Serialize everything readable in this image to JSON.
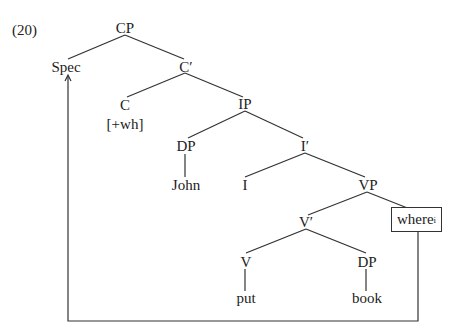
{
  "example_number": "(20)",
  "tree": {
    "nodes": {
      "cp": "CP",
      "spec": "Spec",
      "c_bar": "C′",
      "c": "C",
      "c_feature": "[+wh]",
      "ip": "IP",
      "dp_subject": "DP",
      "i_bar": "I′",
      "john": "John",
      "i": "I",
      "vp": "VP",
      "v_bar": "V′",
      "where": "where",
      "where_index": "i",
      "v": "V",
      "dp_object": "DP",
      "put": "put",
      "book": "book"
    },
    "movement": "where_i moves from VP adjunct position to Spec of CP (arrow)"
  }
}
